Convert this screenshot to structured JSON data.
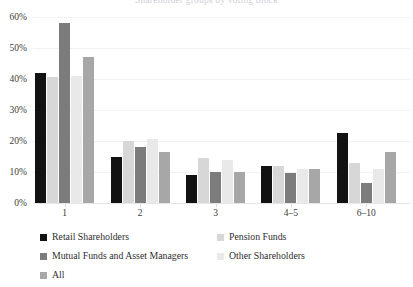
{
  "chart_data": {
    "type": "bar",
    "title": "Shareholder groups by voting block",
    "xlabel": "",
    "ylabel": "",
    "ylim": [
      0,
      60
    ],
    "ytick_labels": [
      "0%",
      "10%",
      "20%",
      "30%",
      "40%",
      "50%",
      "60%"
    ],
    "ytick_values": [
      0,
      10,
      20,
      30,
      40,
      50,
      60
    ],
    "grid": true,
    "legend_position": "below",
    "categories": [
      "1",
      "2",
      "3",
      "4–5",
      "6–10"
    ],
    "series": [
      {
        "name": "Retail Shareholders",
        "color": "#121212",
        "values": [
          42,
          15,
          9,
          12,
          22.5
        ]
      },
      {
        "name": "Pension Funds",
        "color": "#d7d7d7",
        "values": [
          40.5,
          20,
          14.5,
          12,
          13
        ]
      },
      {
        "name": "Mutual Funds and Asset Managers",
        "color": "#7c7c7c",
        "values": [
          58,
          18,
          10,
          9.8,
          6.5
        ]
      },
      {
        "name": "Other Shareholders",
        "color": "#e9e9e9",
        "values": [
          41,
          20.5,
          14,
          11,
          11
        ]
      },
      {
        "name": "All",
        "color": "#a7a7a7",
        "values": [
          47,
          16.5,
          10,
          11,
          16.5
        ]
      }
    ]
  },
  "legend": {
    "entries": [
      {
        "label": "Retail Shareholders",
        "color": "#121212"
      },
      {
        "label": "Pension Funds",
        "color": "#d7d7d7"
      },
      {
        "label": "Mutual Funds and Asset Managers",
        "color": "#7c7c7c"
      },
      {
        "label": "Other Shareholders",
        "color": "#e9e9e9"
      },
      {
        "label": "All",
        "color": "#a7a7a7"
      }
    ]
  },
  "axes": {
    "y_ticks": [
      "0%",
      "10%",
      "20%",
      "30%",
      "40%",
      "50%",
      "60%"
    ],
    "x_ticks": [
      "1",
      "2",
      "3",
      "4–5",
      "6–10"
    ]
  }
}
